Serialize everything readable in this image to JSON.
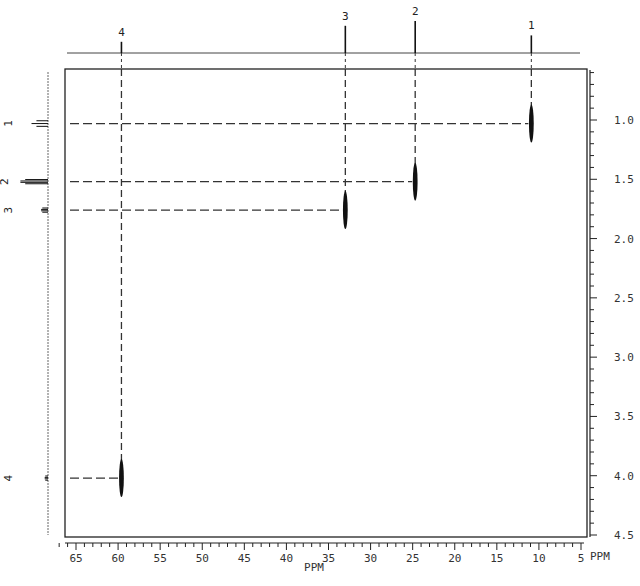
{
  "chart_data": {
    "type": "scatter",
    "subtype": "2D NMR heteronuclear correlation (HETCOR) contour plot",
    "title": "",
    "xlabel": "PPM",
    "ylabel": "PPM",
    "x_axis": {
      "label": "PPM",
      "range": [
        67,
        3
      ],
      "reversed": true,
      "major_ticks": [
        65,
        60,
        55,
        50,
        45,
        40,
        35,
        30,
        25,
        20,
        15,
        10,
        5
      ],
      "minor_step": 1,
      "position": "bottom"
    },
    "y_axis": {
      "label": "PPM",
      "range": [
        0.55,
        4.55
      ],
      "reversed": true,
      "major_ticks": [
        1.0,
        1.5,
        2.0,
        2.5,
        3.0,
        3.5,
        4.0,
        4.5
      ],
      "tick_labels": [
        "1.0",
        "1.5",
        "2.0",
        "2.5",
        "3.0",
        "3.5",
        "4.0",
        "4.5"
      ],
      "minor_step": 0.1,
      "position": "right"
    },
    "top_projection": {
      "label": "13C spectrum",
      "peaks": [
        {
          "label": "4",
          "ppm": 59.6,
          "height": 0.35
        },
        {
          "label": "3",
          "ppm": 33.0,
          "height": 0.85
        },
        {
          "label": "2",
          "ppm": 24.7,
          "height": 1.0
        },
        {
          "label": "1",
          "ppm": 10.9,
          "height": 0.55
        }
      ]
    },
    "left_projection": {
      "label": "1H spectrum",
      "peaks": [
        {
          "label": "1",
          "ppm": 1.03,
          "multiplet": "triplet",
          "height": 0.55
        },
        {
          "label": "2",
          "ppm": 1.52,
          "multiplet": "multiplet",
          "height": 1.0
        },
        {
          "label": "3",
          "ppm": 1.76,
          "multiplet": "multiplet",
          "height": 0.25
        },
        {
          "label": "4",
          "ppm": 4.02,
          "multiplet": "multiplet",
          "height": 0.12
        }
      ]
    },
    "cross_peaks": [
      {
        "label": "1",
        "x_ppm": 10.9,
        "y_ppm": 1.03
      },
      {
        "label": "2",
        "x_ppm": 24.7,
        "y_ppm": 1.52
      },
      {
        "label": "3",
        "x_ppm": 33.0,
        "y_ppm": 1.76
      },
      {
        "label": "4",
        "x_ppm": 59.6,
        "y_ppm": 4.02
      }
    ],
    "grid": false,
    "legend": null,
    "correlation_lines": "dashed"
  },
  "axis": {
    "x_title": "PPM",
    "y_title": "PPM"
  },
  "caption": ""
}
